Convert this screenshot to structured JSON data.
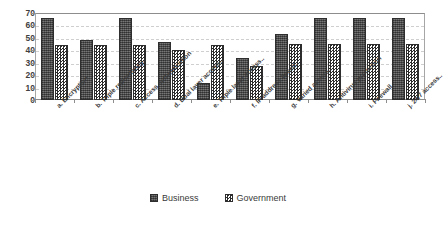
{
  "chart_data": {
    "type": "bar",
    "title": "",
    "subtitle": "",
    "xlabel": "",
    "ylabel": "",
    "ylim": [
      0,
      70
    ],
    "ytick_step": 10,
    "yticks": [
      "70",
      "60",
      "50",
      "40",
      "30",
      "20",
      "10",
      "0"
    ],
    "grid": true,
    "grid_style": "horizontal-dashed",
    "legend_position": "bottom-center",
    "categories": [
      "a. Encryption",
      "b. Triple redundancy..",
      "c. Access authentication",
      "d. Dual layer access..",
      "e. Triple layer access..",
      "f. IP address based..",
      "g. Varied access..",
      "h. Antivirus protection",
      "i. Firewall",
      "j. 24/7 access.."
    ],
    "series": [
      {
        "name": "Business",
        "color": "#5a5a5a",
        "pattern": "solid-dark",
        "values": [
          66,
          48,
          66,
          47,
          14,
          34,
          53,
          66,
          66,
          66
        ]
      },
      {
        "name": "Government",
        "color": "#2b2b2b",
        "pattern": "checkerboard",
        "values": [
          44,
          44,
          44,
          40,
          44,
          27,
          45,
          45,
          45,
          45
        ]
      }
    ]
  },
  "legend": {
    "items": [
      {
        "label": "Business"
      },
      {
        "label": "Government"
      }
    ]
  }
}
